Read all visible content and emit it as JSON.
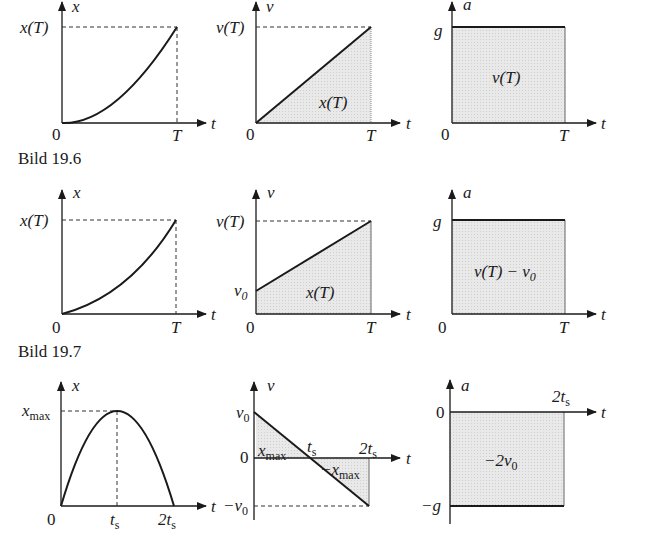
{
  "figures": [
    {
      "caption": "",
      "row": 1,
      "panels": [
        {
          "id": "x-t",
          "axis_y": "x",
          "axis_x": "t",
          "origin": "0",
          "t_end": "T",
          "y_mark": "x(T)",
          "curve": "parabola starting at origin with zero slope, rising to x(T) at T"
        },
        {
          "id": "v-t",
          "axis_y": "v",
          "axis_x": "t",
          "origin": "0",
          "t_end": "T",
          "y_mark": "v(T)",
          "area_label": "x(T)",
          "curve": "straight line from 0 to v(T)"
        },
        {
          "id": "a-t",
          "axis_y": "a",
          "axis_x": "t",
          "origin": "0",
          "t_end": "T",
          "y_mark": "g",
          "area_label": "v(T)",
          "curve": "constant a = g"
        }
      ]
    },
    {
      "caption": "Bild 19.6",
      "row": 2,
      "panels": [
        {
          "id": "x-t",
          "axis_y": "x",
          "axis_x": "t",
          "origin": "0",
          "t_end": "T",
          "y_mark": "x(T)",
          "curve": "parabola starting at origin with non-zero slope"
        },
        {
          "id": "v-t",
          "axis_y": "v",
          "axis_x": "t",
          "origin": "0",
          "t_end": "T",
          "y_mark": "v(T)",
          "y_start": "v0",
          "area_label": "x(T)",
          "curve": "straight line from v0 to v(T)"
        },
        {
          "id": "a-t",
          "axis_y": "a",
          "axis_x": "t",
          "origin": "0",
          "t_end": "T",
          "y_mark": "g",
          "area_label": "v(T) − v0",
          "curve": "constant a = g"
        }
      ]
    },
    {
      "caption": "Bild 19.7",
      "row": 3,
      "panels": [
        {
          "id": "x-t",
          "axis_y": "x",
          "axis_x": "t",
          "origin": "0",
          "t_mid": "ts",
          "t_end": "2ts",
          "y_mark": "xmax",
          "curve": "downward parabola, peak xmax at ts, back to 0 at 2ts"
        },
        {
          "id": "v-t",
          "axis_y": "v",
          "axis_x": "t",
          "y_top": "v0",
          "y_zero": "0",
          "y_bottom": "−v0",
          "t_mid": "ts",
          "t_end": "2ts",
          "area_labels": [
            "xmax",
            "−xmax"
          ],
          "curve": "straight line from v0 to −v0, crossing zero at ts"
        },
        {
          "id": "a-t",
          "axis_y": "a",
          "axis_x": "t",
          "y_zero": "0",
          "y_bottom": "−g",
          "t_end": "2ts",
          "area_label": "−2v0",
          "curve": "constant a = −g"
        }
      ]
    }
  ],
  "labels": {
    "x": "x",
    "v": "v",
    "a": "a",
    "t": "t",
    "zero": "0",
    "T": "T",
    "xT": "x(T)",
    "vT": "v(T)",
    "g": "g",
    "neg_g": "−g",
    "v_base": "v",
    "sub0": "0",
    "neg_v_base": "−v",
    "x_base": "x",
    "max": "max",
    "neg_x_base": "−x",
    "t_base": "t",
    "sub_s": "s",
    "two_t_base": "2t",
    "vT_minus": "v(T) − v",
    "neg_two_v": "−2v"
  },
  "captions": {
    "c196": "Bild 19.6",
    "c197": "Bild 19.7"
  },
  "colors": {
    "line": "#1a1a1a",
    "fill": "#e6e6e6",
    "dash": "#333333"
  }
}
